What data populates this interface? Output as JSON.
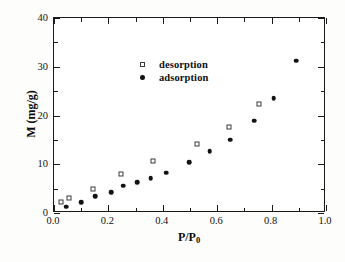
{
  "chart_data": {
    "type": "scatter",
    "title": "",
    "xlabel": "P/P0",
    "xlabel_main": "P/P",
    "xlabel_sub": "0",
    "ylabel": "M (mg/g)",
    "xlim": [
      0.0,
      1.0
    ],
    "ylim": [
      0,
      40
    ],
    "grid": false,
    "legend_position": "upper-left-inside",
    "x_major_ticks": [
      0.0,
      0.2,
      0.4,
      0.6,
      0.8,
      1.0
    ],
    "x_tick_labels": [
      "0.0",
      "0.2",
      "0.4",
      "0.6",
      "0.8",
      "1.0"
    ],
    "x_minor_ticks": [
      0.1,
      0.3,
      0.5,
      0.7,
      0.9
    ],
    "y_major_ticks": [
      0,
      10,
      20,
      30,
      40
    ],
    "y_tick_labels": [
      "0",
      "10",
      "20",
      "30",
      "40"
    ],
    "y_minor_ticks": [
      5,
      15,
      25,
      35
    ],
    "series": [
      {
        "name": "desorption",
        "marker": "open-square",
        "color": "#3a3a3a",
        "points": [
          [
            0.025,
            2.3
          ],
          [
            0.055,
            3.1
          ],
          [
            0.145,
            4.9
          ],
          [
            0.245,
            8.0
          ],
          [
            0.365,
            10.6
          ],
          [
            0.525,
            14.2
          ],
          [
            0.645,
            17.7
          ],
          [
            0.755,
            22.4
          ]
        ]
      },
      {
        "name": "adsorption",
        "marker": "filled-circle",
        "color": "#121212",
        "points": [
          [
            0.045,
            1.3
          ],
          [
            0.1,
            2.2
          ],
          [
            0.152,
            3.4
          ],
          [
            0.21,
            4.3
          ],
          [
            0.255,
            5.6
          ],
          [
            0.305,
            6.3
          ],
          [
            0.355,
            7.1
          ],
          [
            0.412,
            8.3
          ],
          [
            0.497,
            10.4
          ],
          [
            0.573,
            12.7
          ],
          [
            0.648,
            15.0
          ],
          [
            0.737,
            18.9
          ],
          [
            0.808,
            23.6
          ],
          [
            0.89,
            31.2
          ]
        ]
      }
    ]
  },
  "legend": {
    "items": [
      {
        "label": "desorption",
        "marker": "open-square"
      },
      {
        "label": "adsorption",
        "marker": "filled-circle"
      }
    ]
  }
}
